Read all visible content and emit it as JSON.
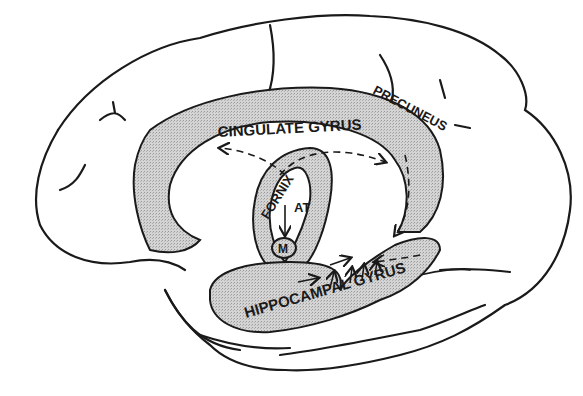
{
  "diagram": {
    "type": "anatomical-illustration",
    "colors": {
      "outline": "#1a1a1a",
      "shade": "#cfcfcf",
      "background": "#ffffff"
    },
    "labels": {
      "cingulate": "CINGULATE GYRUS",
      "precuneus": "PRECUNEUS",
      "fornix": "FORNIX",
      "at": "AT",
      "m": "M",
      "hippocampal": "HIPPOCAMPAL GYRUS"
    }
  }
}
